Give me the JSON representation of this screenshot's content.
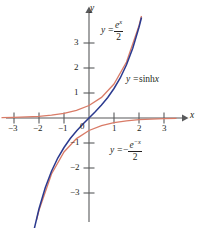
{
  "figure": {
    "background_color": "#ffffff",
    "width": 199,
    "height": 228
  },
  "axes": {
    "x_axis_label": "x",
    "y_axis_label": "y",
    "origin_label": "0",
    "x_ticks": [
      {
        "value": -3,
        "label": "−3"
      },
      {
        "value": -2,
        "label": "−2"
      },
      {
        "value": -1,
        "label": "−1"
      },
      {
        "value": 1,
        "label": "1"
      },
      {
        "value": 2,
        "label": "2"
      },
      {
        "value": 3,
        "label": "3"
      }
    ],
    "y_ticks": [
      {
        "value": 3,
        "label": "3"
      },
      {
        "value": 2,
        "label": "2"
      },
      {
        "value": 1,
        "label": "1"
      },
      {
        "value": -1,
        "label": "−1"
      },
      {
        "value": -2,
        "label": "−2"
      },
      {
        "value": -3,
        "label": "−3"
      }
    ],
    "axis_color": "#58595b"
  },
  "labels": {
    "exp_pos": {
      "lhs": "y =",
      "numerator": "e",
      "exponent": "x",
      "denominator": "2"
    },
    "sinh": {
      "lhs": "y =",
      "rhs": "sinh",
      "arg": "x"
    },
    "exp_neg": {
      "lhs": "y =",
      "minus": "−",
      "numerator": "e",
      "exponent": "−x",
      "denominator": "2"
    }
  },
  "chart_data": {
    "type": "line",
    "title": "",
    "xlabel": "x",
    "ylabel": "y",
    "xlim": [
      -3.6,
      3.7
    ],
    "ylim": [
      -4.2,
      4.3
    ],
    "grid": false,
    "legend_position": "inline-annotations",
    "series": [
      {
        "name": "y = sinh x",
        "color": "#2b3a8f",
        "formula": "sinh(x) = (e^x - e^-x)/2",
        "x": [
          -3.5,
          -3.25,
          -3.0,
          -2.75,
          -2.5,
          -2.25,
          -2.0,
          -1.75,
          -1.5,
          -1.25,
          -1.0,
          -0.75,
          -0.5,
          -0.25,
          0,
          0.25,
          0.5,
          0.75,
          1.0,
          1.25,
          1.5,
          1.75,
          2.0,
          2.1
        ],
        "y": [
          -16.54,
          -12.88,
          -10.02,
          -7.79,
          -6.05,
          -4.69,
          -3.63,
          -2.79,
          -2.13,
          -1.6,
          -1.18,
          -0.82,
          -0.52,
          -0.25,
          0,
          0.25,
          0.52,
          0.82,
          1.18,
          1.6,
          2.13,
          2.79,
          3.63,
          4.02
        ]
      },
      {
        "name": "y = e^x / 2",
        "color": "#d97b67",
        "formula": "e^x/2",
        "x": [
          -3.5,
          -3.0,
          -2.5,
          -2.0,
          -1.5,
          -1.0,
          -0.5,
          0,
          0.5,
          1.0,
          1.5,
          2.0,
          2.1
        ],
        "y": [
          0.015,
          0.025,
          0.041,
          0.068,
          0.112,
          0.184,
          0.303,
          0.5,
          0.824,
          1.359,
          2.241,
          3.695,
          4.08
        ]
      },
      {
        "name": "y = -e^-x / 2",
        "color": "#d97b67",
        "formula": "-e^(-x)/2",
        "x": [
          -2.1,
          -2.0,
          -1.5,
          -1.0,
          -0.5,
          0,
          0.5,
          1.0,
          1.5,
          2.0,
          2.5,
          3.0,
          3.5
        ],
        "y": [
          -4.08,
          -3.695,
          -2.241,
          -1.359,
          -0.824,
          -0.5,
          -0.303,
          -0.184,
          -0.112,
          -0.068,
          -0.041,
          -0.025,
          -0.015
        ]
      }
    ]
  }
}
